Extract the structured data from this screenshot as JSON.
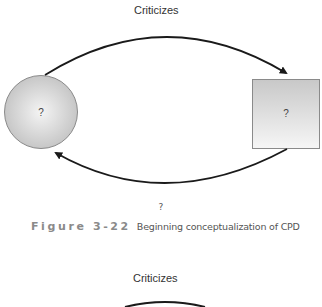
{
  "figure_top": {
    "edge_label": "Criticizes",
    "nodes": [
      {
        "shape": "circle",
        "label": "?"
      },
      {
        "shape": "square",
        "label": "?"
      }
    ],
    "edges": [
      {
        "from": "circle",
        "to": "square",
        "direction": "top-arc"
      },
      {
        "from": "square",
        "to": "circle",
        "direction": "bottom-arc"
      }
    ],
    "bottom_mark": "?"
  },
  "caption": {
    "number": "Figure 3-22",
    "text": "Beginning conceptualization of CPD"
  },
  "figure_next": {
    "edge_label": "Criticizes"
  },
  "colors": {
    "arrow": "#1a1a1a",
    "node_fill_light": "#f2f2f2",
    "node_fill_dark": "#c4c4c4",
    "node_stroke": "#8a8a8a",
    "caption_number": "#8a8a8a"
  }
}
